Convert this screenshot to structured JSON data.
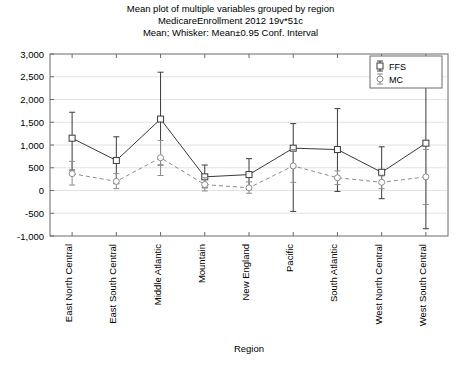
{
  "chart_data": {
    "type": "line",
    "title": "Mean plot of multiple variables grouped by region",
    "subtitle": "MedicareEnrollment 2012 19v*51c",
    "subtitle2": "Mean; Whisker: Mean±0.95 Conf. Interval",
    "xlabel": "Region",
    "ylabel": "",
    "ylim": [
      -1000,
      3000
    ],
    "ytick_labels": [
      "3,000",
      "2,500",
      "2,000",
      "1,500",
      "1,000",
      "500",
      "0",
      "-500",
      "-1,000"
    ],
    "ytick_values": [
      3000,
      2500,
      2000,
      1500,
      1000,
      500,
      0,
      -500,
      -1000
    ],
    "grid": true,
    "legend_position": "top-right",
    "categories": [
      "East North Central",
      "East South Central",
      "Middle Atlantic",
      "Mountain",
      "New England",
      "Pacific",
      "South Atlantic",
      "West North Central",
      "West South Central"
    ],
    "series": [
      {
        "name": "FFS",
        "marker": "square",
        "line_style": "solid",
        "color": "#3a3a3a",
        "values": [
          1150,
          660,
          1570,
          300,
          350,
          930,
          900,
          400,
          1040
        ],
        "ci_low": [
          450,
          150,
          560,
          60,
          30,
          -460,
          -20,
          -180,
          -840
        ],
        "ci_high": [
          1720,
          1180,
          2600,
          560,
          700,
          1470,
          1800,
          960,
          2900
        ]
      },
      {
        "name": "MC",
        "marker": "circle",
        "line_style": "dashed",
        "color": "#8c8c8c",
        "values": [
          370,
          200,
          720,
          130,
          60,
          540,
          280,
          180,
          300
        ],
        "ci_low": [
          120,
          40,
          330,
          -10,
          -60,
          180,
          130,
          40,
          -310
        ],
        "ci_high": [
          640,
          370,
          1100,
          280,
          190,
          900,
          430,
          320,
          900
        ]
      }
    ]
  }
}
